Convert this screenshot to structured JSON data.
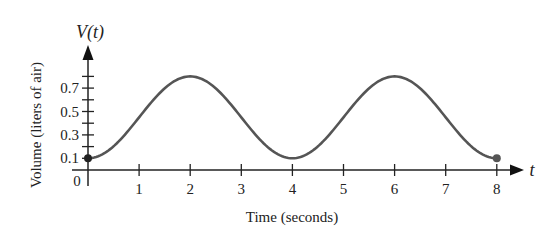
{
  "chart_data": {
    "type": "line",
    "title": "",
    "xlabel": "Time (seconds)",
    "ylabel": "Volume (liters of air)",
    "x_axis_var": "t",
    "y_axis_var": "V(t)",
    "xlim": [
      0,
      8
    ],
    "ylim": [
      0,
      0.8
    ],
    "x_ticks": [
      "1",
      "2",
      "3",
      "4",
      "5",
      "6",
      "7",
      "8"
    ],
    "y_ticks": [
      "0.1",
      "0.3",
      "0.5",
      "0.7"
    ],
    "origin_label": "0",
    "grid": false,
    "legend": null,
    "series": [
      {
        "name": "V(t)",
        "function": "V(t) = 0.45 - 0.35 cos(pi t / 2)",
        "x": [
          0,
          0.5,
          1,
          1.5,
          2,
          2.5,
          3,
          3.5,
          4,
          4.5,
          5,
          5.5,
          6,
          6.5,
          7,
          7.5,
          8
        ],
        "values": [
          0.1,
          0.2,
          0.45,
          0.7,
          0.8,
          0.7,
          0.45,
          0.2,
          0.1,
          0.2,
          0.45,
          0.7,
          0.8,
          0.7,
          0.45,
          0.2,
          0.1
        ],
        "color": "#555555"
      }
    ],
    "endpoints": [
      {
        "t": 0,
        "v": 0.1,
        "style": "filled-dot"
      },
      {
        "t": 8,
        "v": 0.1,
        "style": "filled-dot"
      }
    ]
  }
}
